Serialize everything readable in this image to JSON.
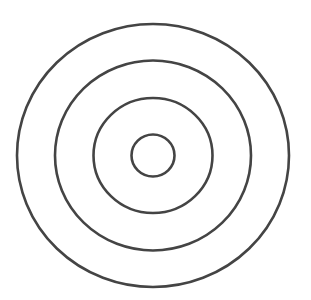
{
  "diagram": {
    "type": "concentric-circles",
    "background": "#ffffff",
    "stroke_color": "#444444",
    "stroke_width": 2.6,
    "center": {
      "x": 153,
      "y": 155.5
    },
    "rings": [
      {
        "name": "outer-ring",
        "rx": 136,
        "ry": 131.5
      },
      {
        "name": "second-ring",
        "rx": 98,
        "ry": 95
      },
      {
        "name": "third-ring",
        "rx": 59.5,
        "ry": 57.5
      },
      {
        "name": "inner-ring",
        "rx": 21.5,
        "ry": 21
      }
    ]
  }
}
